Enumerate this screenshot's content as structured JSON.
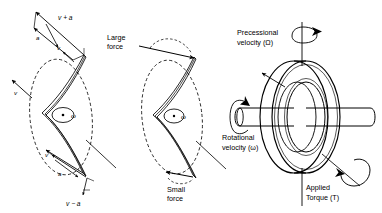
{
  "figure": {
    "background_color": "#ffffff",
    "line_color": "#000000",
    "width": 382,
    "height": 213
  },
  "panels": [
    {
      "id": "left",
      "name": "velocity-vector-panel",
      "labels": {
        "top_resultant": "v + a",
        "top_delta": "a",
        "top_velocity": "v",
        "side_velocity": "v",
        "bottom_velocity": "v",
        "bottom_delta": "a",
        "bottom_resultant": "v − a",
        "spin": "ω"
      }
    },
    {
      "id": "middle",
      "name": "force-panel",
      "labels": {
        "large_force_line1": "Large",
        "large_force_line2": "force",
        "small_force_line1": "Small",
        "small_force_line2": "force",
        "spin": "ω"
      }
    },
    {
      "id": "right",
      "name": "gyroscope-panel",
      "labels": {
        "precessional_line1": "Precessional",
        "precessional_line2": "velocity (Ω)",
        "rotational_line1": "Rotational",
        "rotational_line2": "velocity (ω)",
        "torque_line1": "Applied",
        "torque_line2": "Torque (T)"
      }
    }
  ],
  "symbols": {
    "omega": "ω",
    "big_omega": "Ω",
    "torque": "T"
  }
}
